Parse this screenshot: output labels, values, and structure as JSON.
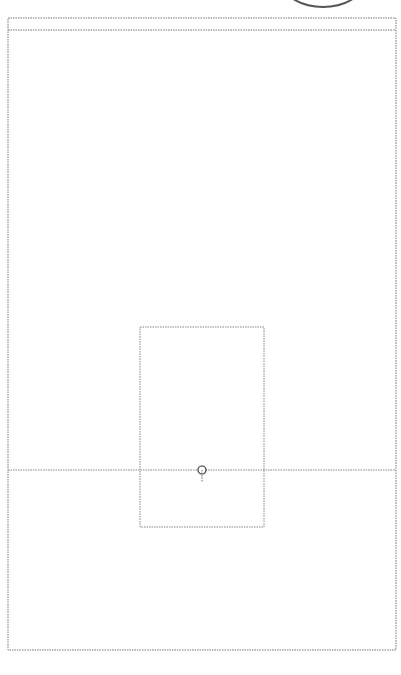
{
  "caption": {
    "text": "va para artesonado."
  },
  "diagram": {
    "type": "one-point perspective construction",
    "vanishing_point": {
      "label": "PF",
      "x": 202,
      "y": 470
    },
    "horizon_line_y": 470,
    "outer_frame": {
      "left": 8,
      "right": 396,
      "top": 18,
      "inner_top": 30,
      "bottom": 650
    },
    "back_wall": {
      "left": 140,
      "right": 264,
      "top": 327,
      "bottom": 527
    },
    "ceiling_v_apex": {
      "x": 202,
      "y": 335
    },
    "floor_grid": {
      "columns": 16,
      "rows": 15,
      "front_y": 650,
      "back_y": 527
    },
    "colors": {
      "line": "#4a4a4a",
      "guide": "#8a8a8a",
      "background": "#ffffff"
    }
  }
}
